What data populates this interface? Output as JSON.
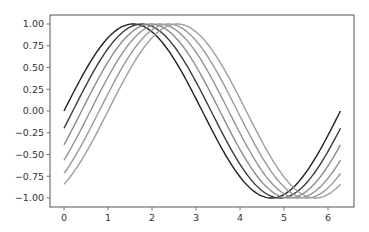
{
  "chart_data": {
    "type": "line",
    "title": "",
    "xlabel": "",
    "ylabel": "",
    "xlim": [
      -0.314,
      6.597
    ],
    "ylim": [
      -1.1,
      1.1
    ],
    "grid": false,
    "legend": null,
    "x_ticks": [
      0,
      1,
      2,
      3,
      4,
      5,
      6
    ],
    "x_tick_labels": [
      "0",
      "1",
      "2",
      "3",
      "4",
      "5",
      "6"
    ],
    "y_ticks": [
      1.0,
      0.75,
      0.5,
      0.25,
      0.0,
      -0.25,
      -0.5,
      -0.75,
      -1.0
    ],
    "y_tick_labels": [
      "1.00",
      "0.75",
      "0.50",
      "0.25",
      "0.00",
      "−0.25",
      "−0.50",
      "−0.75",
      "−1.00"
    ],
    "x_range": [
      0,
      6.2832
    ],
    "series": [
      {
        "name": "sin(x)",
        "phase": 0.0,
        "color": "#1f1f1f",
        "start": 0.0,
        "end": 0.0
      },
      {
        "name": "sin(x-0.2)",
        "phase": 0.2,
        "color": "#3c3c3c",
        "start": -0.2,
        "end": -0.2
      },
      {
        "name": "sin(x-0.4)",
        "phase": 0.4,
        "color": "#8c8c8c",
        "start": -0.39,
        "end": -0.39
      },
      {
        "name": "sin(x-0.6)",
        "phase": 0.6,
        "color": "#939393",
        "start": -0.56,
        "end": -0.56
      },
      {
        "name": "sin(x-0.8)",
        "phase": 0.8,
        "color": "#999999",
        "start": -0.72,
        "end": -0.72
      },
      {
        "name": "sin(x-1.0)",
        "phase": 1.0,
        "color": "#9e9e9e",
        "start": -0.84,
        "end": -0.84
      }
    ]
  },
  "layout": {
    "frame_color": "#555555"
  }
}
